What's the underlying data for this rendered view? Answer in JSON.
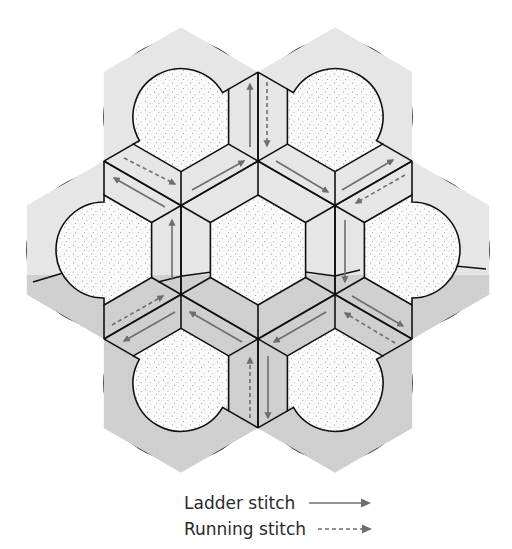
{
  "figure": {
    "colors": {
      "outline": "#111111",
      "light_band": "#e6e6e6",
      "dark_band": "#cfcfcf",
      "stipple_bg": "#fbfbfb",
      "stipple_dot": "#8a8a8a",
      "arrow": "#6e6e6e"
    },
    "geometry": {
      "center": [
        258,
        250
      ],
      "hex_outer_radius": 89,
      "hex_inner_radius": 55,
      "unit_distance": 154,
      "circle_outer_radius": 77,
      "circle_inner_radius": 48,
      "shade_split_y": 275
    },
    "units": [
      {
        "name": "center",
        "angle": null
      },
      {
        "name": "top-left",
        "angle": 240
      },
      {
        "name": "top-right",
        "angle": 300
      },
      {
        "name": "right",
        "angle": 0
      },
      {
        "name": "bottom-right",
        "angle": 60
      },
      {
        "name": "bottom-left",
        "angle": 120
      },
      {
        "name": "left",
        "angle": 180
      }
    ],
    "arrows": [
      {
        "type": "ladder",
        "from": [
          250,
          147
        ],
        "to": [
          250,
          84
        ]
      },
      {
        "type": "running",
        "from": [
          267,
          82
        ],
        "to": [
          267,
          146
        ]
      },
      {
        "type": "running",
        "from": [
          124,
          158
        ],
        "to": [
          175,
          184
        ]
      },
      {
        "type": "ladder",
        "from": [
          165,
          207
        ],
        "to": [
          114,
          178
        ]
      },
      {
        "type": "ladder",
        "from": [
          192,
          190
        ],
        "to": [
          244,
          161
        ]
      },
      {
        "type": "ladder",
        "from": [
          276,
          161
        ],
        "to": [
          328,
          192
        ]
      },
      {
        "type": "ladder",
        "from": [
          342,
          190
        ],
        "to": [
          393,
          160
        ]
      },
      {
        "type": "running",
        "from": [
          405,
          175
        ],
        "to": [
          356,
          203
        ]
      },
      {
        "type": "ladder",
        "from": [
          345,
          220
        ],
        "to": [
          345,
          282
        ]
      },
      {
        "type": "ladder",
        "from": [
          172,
          280
        ],
        "to": [
          172,
          220
        ]
      },
      {
        "type": "running",
        "from": [
          112,
          325
        ],
        "to": [
          163,
          296
        ]
      },
      {
        "type": "ladder",
        "from": [
          175,
          312
        ],
        "to": [
          124,
          341
        ]
      },
      {
        "type": "ladder",
        "from": [
          242,
          342
        ],
        "to": [
          190,
          312
        ]
      },
      {
        "type": "ladder",
        "from": [
          326,
          312
        ],
        "to": [
          274,
          342
        ]
      },
      {
        "type": "ladder",
        "from": [
          352,
          296
        ],
        "to": [
          403,
          326
        ]
      },
      {
        "type": "running",
        "from": [
          395,
          343
        ],
        "to": [
          345,
          313
        ]
      },
      {
        "type": "running",
        "from": [
          250,
          418
        ],
        "to": [
          250,
          358
        ]
      },
      {
        "type": "ladder",
        "from": [
          268,
          356
        ],
        "to": [
          268,
          418
        ]
      }
    ]
  },
  "legend": {
    "items": [
      {
        "label": "Ladder stitch",
        "style": "ladder"
      },
      {
        "label": "Running stitch",
        "style": "running"
      }
    ]
  }
}
